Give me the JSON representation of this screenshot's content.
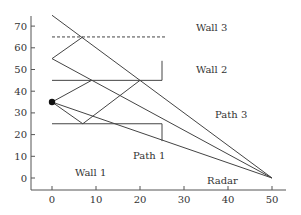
{
  "diagram": {
    "type": "ray-tracing multipath geometry",
    "axes": {
      "x_ticks": [
        "0",
        "10",
        "20",
        "30",
        "40",
        "50"
      ],
      "y_ticks": [
        "0",
        "10",
        "20",
        "30",
        "40",
        "50",
        "60",
        "70"
      ],
      "x_range": [
        -4,
        53
      ],
      "y_range": [
        -6,
        76
      ]
    },
    "labels": {
      "wall1": "Wall 1",
      "wall2": "Wall 2",
      "wall3": "Wall 3",
      "path1": "Path 1",
      "path3": "Path 3",
      "radar": "Radar"
    },
    "walls": [
      {
        "name": "Wall 1",
        "points": [
          [
            0,
            25
          ],
          [
            25,
            25
          ],
          [
            25,
            17
          ]
        ]
      },
      {
        "name": "Wall 2",
        "points": [
          [
            0,
            45
          ],
          [
            25,
            45
          ],
          [
            25,
            54
          ]
        ]
      },
      {
        "name": "Wall 3",
        "points": [
          [
            0,
            65
          ],
          [
            26,
            65
          ]
        ],
        "style": "dashed"
      }
    ],
    "source": {
      "x": 0,
      "y": 35
    },
    "radar": {
      "x": 50,
      "y": 0
    },
    "rays": [
      {
        "points": [
          [
            0,
            75
          ],
          [
            50,
            0
          ]
        ]
      },
      {
        "points": [
          [
            0,
            55
          ],
          [
            50,
            0
          ]
        ]
      },
      {
        "points": [
          [
            0,
            35
          ],
          [
            50,
            0
          ]
        ]
      },
      {
        "points": [
          [
            0,
            55
          ],
          [
            7,
            65
          ]
        ]
      },
      {
        "points": [
          [
            0,
            35
          ],
          [
            9,
            45
          ]
        ]
      },
      {
        "points": [
          [
            0,
            35
          ],
          [
            7,
            25
          ],
          [
            20,
            45
          ]
        ]
      }
    ]
  }
}
